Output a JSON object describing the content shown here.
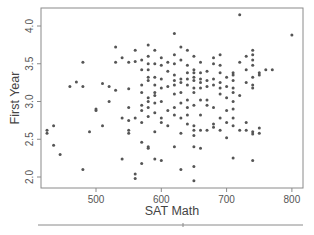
{
  "chart_data": {
    "type": "scatter",
    "title": "",
    "xlabel": "SAT Math",
    "ylabel": "First Year",
    "xlim": [
      415,
      815
    ],
    "ylim": [
      1.85,
      4.23
    ],
    "xticks": [
      500,
      600,
      700,
      800
    ],
    "yticks": [
      2.0,
      2.5,
      3.0,
      3.5,
      4.0
    ],
    "xtick_labels": [
      "500",
      "600",
      "700",
      "800"
    ],
    "ytick_labels": [
      "2.0",
      "2.5",
      "3.0",
      "3.5",
      "4.0"
    ],
    "grid": false,
    "legend": null,
    "marker_color": "#555555",
    "points": [
      [
        425,
        2.62
      ],
      [
        425,
        2.58
      ],
      [
        435,
        2.68
      ],
      [
        435,
        2.42
      ],
      [
        445,
        2.3
      ],
      [
        460,
        3.2
      ],
      [
        470,
        3.26
      ],
      [
        480,
        3.2
      ],
      [
        480,
        3.52
      ],
      [
        480,
        2.1
      ],
      [
        490,
        2.6
      ],
      [
        500,
        2.88
      ],
      [
        500,
        2.9
      ],
      [
        510,
        3.24
      ],
      [
        510,
        2.68
      ],
      [
        520,
        3.2
      ],
      [
        520,
        3.0
      ],
      [
        530,
        3.72
      ],
      [
        530,
        3.52
      ],
      [
        530,
        3.15
      ],
      [
        540,
        3.58
      ],
      [
        540,
        2.78
      ],
      [
        540,
        2.24
      ],
      [
        550,
        3.52
      ],
      [
        550,
        3.17
      ],
      [
        550,
        2.92
      ],
      [
        550,
        2.75
      ],
      [
        550,
        2.62
      ],
      [
        550,
        2.58
      ],
      [
        560,
        3.68
      ],
      [
        560,
        3.53
      ],
      [
        560,
        2.78
      ],
      [
        560,
        2.04
      ],
      [
        560,
        1.98
      ],
      [
        570,
        3.55
      ],
      [
        570,
        3.42
      ],
      [
        570,
        3.22
      ],
      [
        570,
        3.12
      ],
      [
        570,
        2.95
      ],
      [
        570,
        2.88
      ],
      [
        570,
        2.72
      ],
      [
        570,
        2.46
      ],
      [
        570,
        2.18
      ],
      [
        580,
        3.75
      ],
      [
        580,
        3.6
      ],
      [
        580,
        3.5
      ],
      [
        580,
        3.42
      ],
      [
        580,
        3.32
      ],
      [
        580,
        3.28
      ],
      [
        580,
        3.05
      ],
      [
        580,
        3.0
      ],
      [
        580,
        2.92
      ],
      [
        580,
        2.8
      ],
      [
        580,
        2.4
      ],
      [
        580,
        2.38
      ],
      [
        590,
        3.68
      ],
      [
        590,
        3.5
      ],
      [
        590,
        3.32
      ],
      [
        590,
        3.22
      ],
      [
        590,
        3.12
      ],
      [
        590,
        3.08
      ],
      [
        590,
        2.98
      ],
      [
        590,
        2.85
      ],
      [
        590,
        2.6
      ],
      [
        590,
        2.24
      ],
      [
        600,
        3.58
      ],
      [
        600,
        3.48
      ],
      [
        600,
        3.3
      ],
      [
        600,
        3.18
      ],
      [
        600,
        3.0
      ],
      [
        600,
        2.78
      ],
      [
        600,
        2.72
      ],
      [
        600,
        2.22
      ],
      [
        610,
        3.52
      ],
      [
        610,
        3.4
      ],
      [
        610,
        3.2
      ],
      [
        610,
        2.88
      ],
      [
        610,
        2.68
      ],
      [
        620,
        3.9
      ],
      [
        620,
        3.62
      ],
      [
        620,
        3.5
      ],
      [
        620,
        3.35
      ],
      [
        620,
        3.28
      ],
      [
        620,
        3.22
      ],
      [
        620,
        3.1
      ],
      [
        620,
        2.92
      ],
      [
        620,
        2.82
      ],
      [
        620,
        2.4
      ],
      [
        630,
        3.72
      ],
      [
        630,
        3.55
      ],
      [
        630,
        3.3
      ],
      [
        630,
        3.25
      ],
      [
        630,
        3.12
      ],
      [
        630,
        2.98
      ],
      [
        630,
        2.78
      ],
      [
        630,
        2.58
      ],
      [
        630,
        2.1
      ],
      [
        640,
        3.68
      ],
      [
        640,
        3.48
      ],
      [
        640,
        3.38
      ],
      [
        640,
        3.3
      ],
      [
        640,
        3.22
      ],
      [
        640,
        3.02
      ],
      [
        640,
        2.92
      ],
      [
        640,
        2.82
      ],
      [
        640,
        2.7
      ],
      [
        650,
        3.6
      ],
      [
        650,
        3.42
      ],
      [
        650,
        3.38
      ],
      [
        650,
        3.32
      ],
      [
        650,
        3.28
      ],
      [
        650,
        3.18
      ],
      [
        650,
        3.12
      ],
      [
        650,
        2.95
      ],
      [
        650,
        2.68
      ],
      [
        650,
        2.62
      ],
      [
        650,
        2.55
      ],
      [
        650,
        2.4
      ],
      [
        650,
        2.14
      ],
      [
        650,
        1.95
      ],
      [
        660,
        3.52
      ],
      [
        660,
        3.38
      ],
      [
        660,
        3.3
      ],
      [
        660,
        3.25
      ],
      [
        660,
        3.18
      ],
      [
        660,
        3.02
      ],
      [
        660,
        2.82
      ],
      [
        660,
        2.62
      ],
      [
        660,
        2.38
      ],
      [
        670,
        3.4
      ],
      [
        670,
        3.28
      ],
      [
        670,
        3.2
      ],
      [
        670,
        3.02
      ],
      [
        670,
        2.95
      ],
      [
        670,
        2.62
      ],
      [
        680,
        3.58
      ],
      [
        680,
        3.5
      ],
      [
        680,
        3.3
      ],
      [
        680,
        3.22
      ],
      [
        680,
        2.92
      ],
      [
        680,
        2.7
      ],
      [
        680,
        2.66
      ],
      [
        690,
        3.62
      ],
      [
        690,
        3.48
      ],
      [
        690,
        3.38
      ],
      [
        690,
        3.25
      ],
      [
        690,
        3.18
      ],
      [
        690,
        3.1
      ],
      [
        690,
        2.78
      ],
      [
        690,
        2.62
      ],
      [
        700,
        3.32
      ],
      [
        700,
        3.2
      ],
      [
        700,
        3.05
      ],
      [
        700,
        2.88
      ],
      [
        700,
        2.72
      ],
      [
        700,
        2.52
      ],
      [
        710,
        3.38
      ],
      [
        710,
        3.35
      ],
      [
        710,
        3.28
      ],
      [
        710,
        3.18
      ],
      [
        710,
        3.12
      ],
      [
        710,
        3.0
      ],
      [
        710,
        2.9
      ],
      [
        710,
        2.78
      ],
      [
        710,
        2.68
      ],
      [
        710,
        2.25
      ],
      [
        720,
        4.15
      ],
      [
        720,
        3.52
      ],
      [
        720,
        3.08
      ],
      [
        720,
        2.62
      ],
      [
        730,
        3.6
      ],
      [
        730,
        3.42
      ],
      [
        730,
        3.25
      ],
      [
        730,
        2.72
      ],
      [
        730,
        2.62
      ],
      [
        740,
        3.68
      ],
      [
        740,
        3.62
      ],
      [
        740,
        3.55
      ],
      [
        740,
        3.48
      ],
      [
        740,
        3.32
      ],
      [
        740,
        3.22
      ],
      [
        740,
        3.18
      ],
      [
        740,
        2.6
      ],
      [
        740,
        2.57
      ],
      [
        740,
        2.22
      ],
      [
        750,
        3.38
      ],
      [
        750,
        3.35
      ],
      [
        750,
        2.65
      ],
      [
        750,
        2.58
      ],
      [
        760,
        3.42
      ],
      [
        770,
        3.42
      ],
      [
        800,
        3.88
      ]
    ]
  }
}
